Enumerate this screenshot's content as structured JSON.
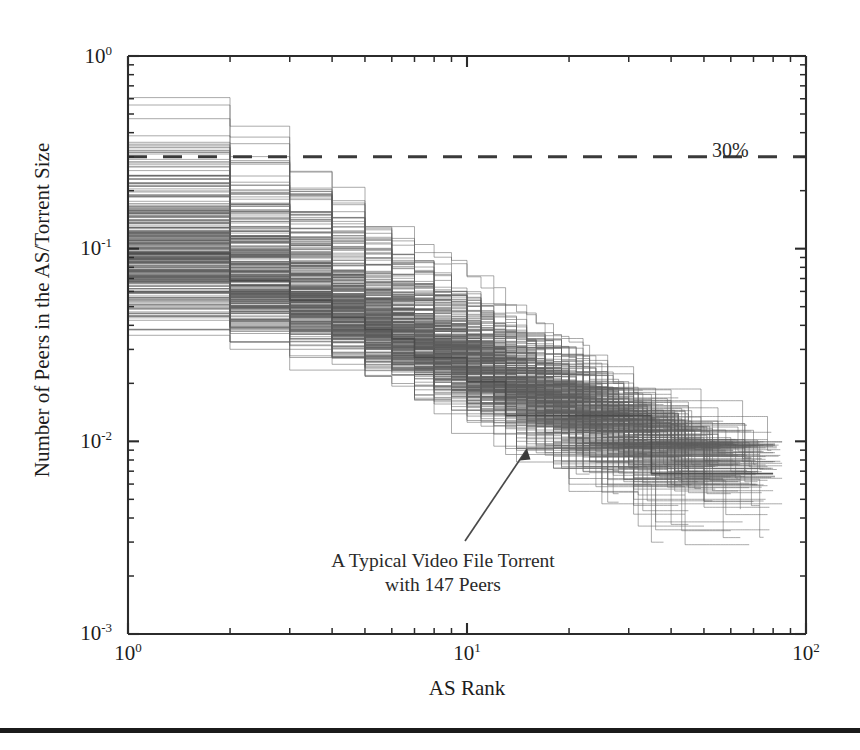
{
  "figure": {
    "background_color": "#ffffff",
    "line_color": "#5d5d5d",
    "axis_color": "#2b2b2b",
    "footer_rule": true
  },
  "axes": {
    "x_title": "AS Rank",
    "y_title": "Number of Peers in the AS/Torrent Size",
    "x_ticks": [
      {
        "value": 1,
        "mantissa": "10",
        "exponent": "0"
      },
      {
        "value": 10,
        "mantissa": "10",
        "exponent": "1"
      },
      {
        "value": 100,
        "mantissa": "10",
        "exponent": "2"
      }
    ],
    "y_ticks": [
      {
        "value": 1,
        "mantissa": "10",
        "exponent": "0"
      },
      {
        "value": 0.1,
        "mantissa": "10",
        "exponent": "-1"
      },
      {
        "value": 0.01,
        "mantissa": "10",
        "exponent": "-2"
      },
      {
        "value": 0.001,
        "mantissa": "10",
        "exponent": "-3"
      }
    ]
  },
  "annotations": {
    "threshold_label": "30%",
    "callout_line1": "A Typical Video File Torrent",
    "callout_line2": "with 147 Peers"
  },
  "chart_data": {
    "type": "line",
    "title": "",
    "subtitle": "",
    "xlabel": "AS Rank",
    "ylabel": "Number of Peers in the AS/Torrent Size",
    "xscale": "log",
    "yscale": "log",
    "xlim": [
      1,
      100
    ],
    "ylim": [
      0.001,
      1
    ],
    "grid": false,
    "legend": null,
    "xtick_labels": [
      "10^0",
      "10^1",
      "10^2"
    ],
    "ytick_labels": [
      "10^0",
      "10^-1",
      "10^-2",
      "10^-3"
    ],
    "annotations": [
      {
        "text": "30%",
        "kind": "threshold-line-label",
        "y": 0.3,
        "style": "dashed horizontal line spanning full width, label at right",
        "x_text": 62,
        "y_text": 0.24
      },
      {
        "text": "A Typical Video File Torrent with 147 Peers",
        "kind": "arrow-callout",
        "arrow_from": {
          "x": 11.5,
          "y": 0.0028
        },
        "arrow_to": {
          "x": 15.0,
          "y": 0.0115
        }
      }
    ],
    "threshold": {
      "value": 0.3,
      "label": "30%",
      "style": "dashed"
    },
    "series": [
      {
        "name": "typical-video-file-torrent-147-peers",
        "highlighted": true,
        "x": [
          1,
          2,
          3,
          4,
          5,
          6,
          7,
          8,
          10,
          12,
          15,
          20,
          30,
          50,
          80
        ],
        "y": [
          0.095,
          0.068,
          0.054,
          0.044,
          0.038,
          0.034,
          0.03,
          0.027,
          0.023,
          0.02,
          0.0115,
          0.0115,
          0.0105,
          0.0095,
          0.0088
        ]
      },
      {
        "name": "envelope-upper",
        "highlighted": false,
        "x": [
          1,
          2,
          3,
          4,
          5,
          6,
          8,
          10,
          15,
          20,
          30,
          50,
          80
        ],
        "y": [
          0.4,
          0.3,
          0.22,
          0.16,
          0.12,
          0.1,
          0.072,
          0.058,
          0.04,
          0.03,
          0.02,
          0.014,
          0.012
        ]
      },
      {
        "name": "envelope-median",
        "highlighted": false,
        "x": [
          1,
          2,
          3,
          4,
          5,
          6,
          8,
          10,
          15,
          20,
          30,
          50,
          80
        ],
        "y": [
          0.09,
          0.068,
          0.056,
          0.047,
          0.041,
          0.037,
          0.03,
          0.026,
          0.019,
          0.016,
          0.0125,
          0.0102,
          0.0092
        ]
      },
      {
        "name": "envelope-lower",
        "highlighted": false,
        "x": [
          1,
          2,
          3,
          4,
          5,
          6,
          8,
          10,
          15,
          20,
          30,
          50,
          80
        ],
        "y": [
          0.034,
          0.03,
          0.027,
          0.024,
          0.021,
          0.019,
          0.0155,
          0.0135,
          0.0095,
          0.0072,
          0.005,
          0.0032,
          0.0019
        ]
      }
    ],
    "series_count_approx": 300,
    "value_range": {
      "y_min": 0.0019,
      "y_max": 0.4,
      "x_min": 1,
      "x_max": 85
    }
  }
}
